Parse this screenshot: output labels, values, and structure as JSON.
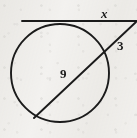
{
  "figure": {
    "name": "circle-tangent-secant-figure",
    "kind": "geometry-diagram",
    "canvas": {
      "width": 137,
      "height": 138
    },
    "background_color": "#f4f3f1",
    "stroke_color": "#1b1b1b"
  },
  "labels": {
    "tangent_segment": "x",
    "external_secant_segment": "3",
    "chord_segment": "9"
  },
  "geometry": {
    "circle": {
      "cx": 60,
      "cy": 73,
      "r": 49,
      "stroke_width": 1.9
    },
    "tangent_line": {
      "x1": 22,
      "y1": 21,
      "x2": 137,
      "y2": 21,
      "stroke_width": 1.9
    },
    "secant_line": {
      "x1": 136,
      "y1": 22,
      "x2": 34,
      "y2": 118,
      "stroke_width": 1.9
    },
    "external_vertex": {
      "x": 136,
      "y": 22
    },
    "tangent_point": {
      "x": 58,
      "y": 24
    },
    "secant_near_intersection": {
      "x": 104,
      "y": 55
    },
    "secant_far_intersection": {
      "x": 34,
      "y": 118
    }
  },
  "label_positions": {
    "x": {
      "left": 101,
      "top": 7
    },
    "three": {
      "left": 117,
      "top": 39
    },
    "nine": {
      "left": 60,
      "top": 67
    }
  }
}
